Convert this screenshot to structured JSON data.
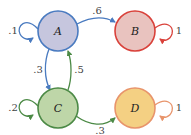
{
  "diagram": {
    "type": "markov-chain-state-diagram",
    "nodes": [
      {
        "id": "A",
        "label": "A",
        "cx": 58,
        "cy": 31,
        "r": 20,
        "fill": "#c6c6de",
        "stroke": "#4a7bc0"
      },
      {
        "id": "B",
        "label": "B",
        "cx": 135,
        "cy": 31,
        "r": 20,
        "fill": "#e9c3bf",
        "stroke": "#d9413a"
      },
      {
        "id": "C",
        "label": "C",
        "cx": 58,
        "cy": 108,
        "r": 20,
        "fill": "#bed6a8",
        "stroke": "#4c8a46"
      },
      {
        "id": "D",
        "label": "D",
        "cx": 135,
        "cy": 108,
        "r": 20,
        "fill": "#f4d083",
        "stroke": "#e8946b"
      }
    ],
    "edges": [
      {
        "from": "A",
        "to": "A",
        "label": ".1",
        "color": "#4a7bc0"
      },
      {
        "from": "A",
        "to": "B",
        "label": ".6",
        "color": "#4a7bc0"
      },
      {
        "from": "A",
        "to": "C",
        "label": ".3",
        "color": "#4a7bc0"
      },
      {
        "from": "C",
        "to": "A",
        "label": ".5",
        "color": "#4c8a46"
      },
      {
        "from": "B",
        "to": "B",
        "label": "1",
        "color": "#d9413a"
      },
      {
        "from": "C",
        "to": "C",
        "label": ".2",
        "color": "#4c8a46"
      },
      {
        "from": "C",
        "to": "D",
        "label": ".3",
        "color": "#4c8a46"
      },
      {
        "from": "D",
        "to": "D",
        "label": "1",
        "color": "#e8946b"
      }
    ]
  }
}
